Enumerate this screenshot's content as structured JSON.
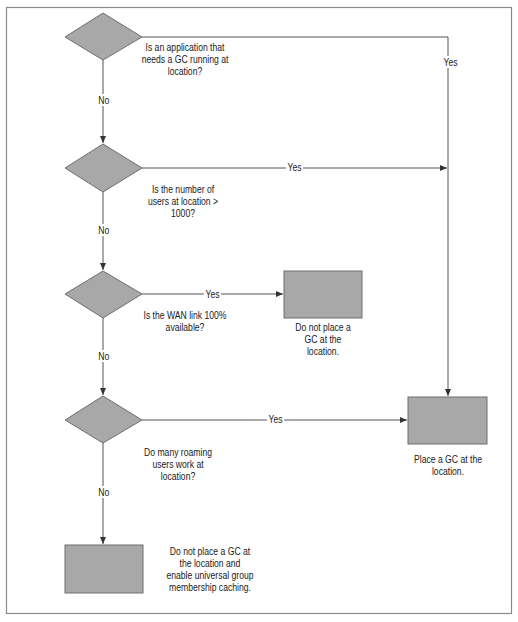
{
  "colors": {
    "shape_fill": "#a8a8a8",
    "shape_stroke": "#6e6e6e",
    "line": "#555555",
    "border": "#888888",
    "background": "#ffffff"
  },
  "decisions": [
    {
      "id": "d1",
      "question_lines": [
        "Is an application that",
        "needs a GC running at",
        "location?"
      ],
      "no_label": "No",
      "yes_label": "Yes"
    },
    {
      "id": "d2",
      "question_lines": [
        "Is the number of",
        "users at location >",
        "1000?"
      ],
      "no_label": "No",
      "yes_label": "Yes"
    },
    {
      "id": "d3",
      "question_lines": [
        "Is the WAN link 100%",
        "available?"
      ],
      "no_label": "No",
      "yes_label": "Yes"
    },
    {
      "id": "d4",
      "question_lines": [
        "Do many roaming",
        "users work at",
        "location?"
      ],
      "no_label": "No",
      "yes_label": "Yes"
    }
  ],
  "outcomes": [
    {
      "id": "o-no-gc",
      "text_lines": [
        "Do not place a",
        "GC at the",
        "location."
      ]
    },
    {
      "id": "o-place-gc",
      "text_lines": [
        "Place a GC at the",
        "location."
      ]
    },
    {
      "id": "o-caching",
      "text_lines": [
        "Do not place a GC at",
        "the location and",
        "enable universal group",
        "membership caching."
      ]
    }
  ]
}
